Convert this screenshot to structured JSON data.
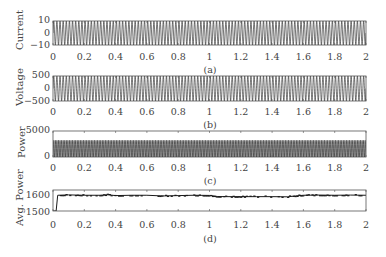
{
  "chart_data": [
    {
      "type": "line",
      "panel": "(a)",
      "title": "",
      "xlabel": "",
      "ylabel": "Current",
      "x_range": [
        0,
        2
      ],
      "ylim": [
        -10,
        10
      ],
      "x_ticks": [
        "0",
        "0.2",
        "0.4",
        "0.6",
        "0.8",
        "1",
        "1.2",
        "1.4",
        "1.6",
        "1.8",
        "2"
      ],
      "y_ticks": [
        "10",
        "0",
        "−10"
      ],
      "description": "Dense sinusoidal AC current oscillating between about -10 and +10 (~50 Hz)",
      "amplitude": 10,
      "frequency_hz": 50,
      "grid": false
    },
    {
      "type": "line",
      "panel": "(b)",
      "title": "",
      "xlabel": "",
      "ylabel": "Voltage",
      "x_range": [
        0,
        2
      ],
      "ylim": [
        -500,
        500
      ],
      "x_ticks": [
        "0",
        "0.2",
        "0.4",
        "0.6",
        "0.8",
        "1",
        "1.2",
        "1.4",
        "1.6",
        "1.8",
        "2"
      ],
      "y_ticks": [
        "500",
        "0",
        "−500"
      ],
      "description": "Dense sinusoidal AC voltage oscillating between about -500 and +500 (~50 Hz)",
      "amplitude": 500,
      "frequency_hz": 50,
      "grid": false
    },
    {
      "type": "line",
      "panel": "(c)",
      "title": "",
      "xlabel": "",
      "ylabel": "Power",
      "x_range": [
        0,
        2
      ],
      "ylim": [
        0,
        5000
      ],
      "x_ticks": [
        "0",
        "0.2",
        "0.4",
        "0.6",
        "0.8",
        "1",
        "1.2",
        "1.4",
        "1.6",
        "1.8",
        "2"
      ],
      "y_ticks": [
        "5000",
        "0"
      ],
      "description": "Instantaneous power oscillating between about 0 and 3200",
      "min": 0,
      "max": 3200,
      "grid": false
    },
    {
      "type": "line",
      "panel": "(d)",
      "title": "",
      "xlabel": "",
      "ylabel": "Avg. Power",
      "x_range": [
        0,
        2
      ],
      "ylim": [
        1500,
        1620
      ],
      "x_ticks": [
        "0",
        "0.2",
        "0.4",
        "0.6",
        "0.8",
        "1",
        "1.2",
        "1.4",
        "1.6",
        "1.8",
        "2"
      ],
      "y_ticks": [
        "1600",
        "1500"
      ],
      "description": "Average power rising at t≈0.02 from 1500 to ~1590 and then fluctuating around 1580-1590 with small step noise",
      "x": [
        0,
        0.02,
        0.03,
        0.1,
        0.2,
        0.3,
        0.35,
        0.4,
        0.5,
        0.6,
        0.7,
        0.8,
        0.9,
        1.0,
        1.05,
        1.1,
        1.2,
        1.3,
        1.4,
        1.5,
        1.55,
        1.6,
        1.7,
        1.8,
        1.9,
        2.0
      ],
      "y": [
        1500,
        1500,
        1590,
        1592,
        1590,
        1590,
        1593,
        1588,
        1590,
        1590,
        1586,
        1588,
        1590,
        1589,
        1583,
        1582,
        1582,
        1582,
        1582,
        1581,
        1586,
        1590,
        1591,
        1590,
        1591,
        1590
      ],
      "grid": false
    }
  ],
  "panels": {
    "a": {
      "ylabel": "Current",
      "yticks": [
        "10",
        "0",
        "−10"
      ],
      "caption": "(a)"
    },
    "b": {
      "ylabel": "Voltage",
      "yticks": [
        "500",
        "0",
        "−500"
      ],
      "caption": "(b)"
    },
    "c": {
      "ylabel": "Power",
      "yticks": [
        "5000",
        "0"
      ],
      "caption": "(c)"
    },
    "d": {
      "ylabel": "Avg. Power",
      "yticks": [
        "1600",
        "1500"
      ],
      "caption": "(d)"
    }
  },
  "xticks": [
    "0",
    "0.2",
    "0.4",
    "0.6",
    "0.8",
    "1",
    "1.2",
    "1.4",
    "1.6",
    "1.8",
    "2"
  ],
  "colors": {
    "line": "#1a1a1a",
    "axis": "#555555",
    "text": "#444444"
  }
}
